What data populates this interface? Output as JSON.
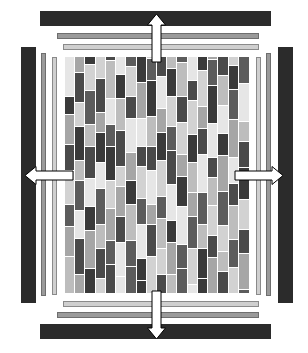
{
  "figure": {
    "canvas": {
      "width": 308,
      "height": 353,
      "background": "#ffffff"
    }
  },
  "palette": {
    "frame_dark": "#2b2b2b",
    "rail_mid": "#9a9a9a",
    "rail_light": "#cfcfcf",
    "rail_stroke_mid": "#6e6e6e",
    "rail_stroke_light": "#8a8a8a",
    "arrow_fill": "#ffffff",
    "arrow_stroke": "#000000",
    "cell_grid_line": "#ffffff",
    "swatches": [
      "#2c2c2c",
      "#3a3a3a",
      "#4a4a4a",
      "#5c5c5c",
      "#707070",
      "#8a8a8a",
      "#a6a6a6",
      "#bdbdbd",
      "#d2d2d2",
      "#e6e6e6"
    ]
  },
  "frame_bars": [
    {
      "name": "top-frame-bar",
      "edge": "top",
      "kind": "dark",
      "x": 40,
      "y": 11,
      "w": 231,
      "h": 15
    },
    {
      "name": "bottom-frame-bar",
      "edge": "bottom",
      "kind": "dark",
      "x": 40,
      "y": 324,
      "w": 231,
      "h": 15
    },
    {
      "name": "left-frame-bar",
      "edge": "left",
      "kind": "dark",
      "x": 21,
      "y": 47,
      "w": 15,
      "h": 256
    },
    {
      "name": "right-frame-bar",
      "edge": "right",
      "kind": "dark",
      "x": 278,
      "y": 47,
      "w": 15,
      "h": 256
    }
  ],
  "rail_bars": [
    {
      "name": "top-rail-outer",
      "edge": "top",
      "kind": "mid",
      "x": 57,
      "y": 33,
      "w": 202,
      "h": 6
    },
    {
      "name": "top-rail-inner",
      "edge": "top",
      "kind": "light",
      "x": 63,
      "y": 44,
      "w": 196,
      "h": 6
    },
    {
      "name": "bottom-rail-inner",
      "edge": "bottom",
      "kind": "light",
      "x": 63,
      "y": 301,
      "w": 196,
      "h": 6
    },
    {
      "name": "bottom-rail-outer",
      "edge": "bottom",
      "kind": "mid",
      "x": 57,
      "y": 312,
      "w": 202,
      "h": 6
    },
    {
      "name": "left-rail-outer",
      "edge": "left",
      "kind": "mid",
      "x": 41,
      "y": 53,
      "w": 5,
      "h": 243
    },
    {
      "name": "left-rail-inner",
      "edge": "left",
      "kind": "light",
      "x": 52,
      "y": 57,
      "w": 5,
      "h": 238
    },
    {
      "name": "right-rail-inner",
      "edge": "right",
      "kind": "light",
      "x": 256,
      "y": 57,
      "w": 5,
      "h": 238
    },
    {
      "name": "right-rail-outer",
      "edge": "right",
      "kind": "mid",
      "x": 266,
      "y": 53,
      "w": 5,
      "h": 243
    }
  ],
  "arrows": [
    {
      "name": "arrow-up",
      "direction": "up",
      "label": "expansion up",
      "x": 151,
      "y": 14,
      "length": 48,
      "thickness": 9
    },
    {
      "name": "arrow-down",
      "direction": "down",
      "label": "expansion down",
      "x": 151,
      "y": 291,
      "length": 48,
      "thickness": 9
    },
    {
      "name": "arrow-left",
      "direction": "left",
      "label": "expansion left",
      "x": 25,
      "y": 170,
      "length": 48,
      "thickness": 9
    },
    {
      "name": "arrow-right",
      "direction": "right",
      "label": "expansion right",
      "x": 235,
      "y": 170,
      "length": 48,
      "thickness": 9
    }
  ],
  "grid": {
    "name": "block-grid",
    "x": 65,
    "y": 57,
    "width": 184,
    "height": 237,
    "columns": 18,
    "description": "Interlocking staggered vertical blocks in shades of grey",
    "column_data": [
      {
        "offset": 0,
        "cells": [
          40,
          18,
          30,
          26,
          34,
          22,
          30,
          38
        ]
      },
      {
        "offset": 16,
        "cells": [
          30,
          24,
          34,
          20,
          30,
          28,
          36,
          34
        ]
      },
      {
        "offset": 8,
        "cells": [
          26,
          34,
          22,
          32,
          28,
          24,
          38,
          32
        ]
      },
      {
        "offset": 22,
        "cells": [
          34,
          20,
          30,
          26,
          36,
          24,
          30,
          36
        ]
      },
      {
        "offset": 4,
        "cells": [
          38,
          26,
          22,
          34,
          28,
          32,
          24,
          36
        ]
      },
      {
        "offset": 18,
        "cells": [
          24,
          32,
          36,
          20,
          30,
          26,
          34,
          28
        ]
      },
      {
        "offset": 10,
        "cells": [
          30,
          22,
          34,
          28,
          24,
          36,
          26,
          32
        ]
      },
      {
        "offset": 26,
        "cells": [
          36,
          28,
          20,
          32,
          26,
          34,
          22,
          30
        ]
      },
      {
        "offset": 2,
        "cells": [
          22,
          36,
          30,
          24,
          34,
          20,
          32,
          38
        ]
      },
      {
        "offset": 20,
        "cells": [
          32,
          24,
          28,
          36,
          22,
          30,
          26,
          34
        ]
      },
      {
        "offset": 12,
        "cells": [
          28,
          30,
          24,
          34,
          36,
          22,
          32,
          20
        ]
      },
      {
        "offset": 6,
        "cells": [
          34,
          26,
          32,
          22,
          30,
          38,
          24,
          28
        ]
      },
      {
        "offset": 24,
        "cells": [
          20,
          34,
          28,
          30,
          24,
          32,
          36,
          26
        ]
      },
      {
        "offset": 14,
        "cells": [
          36,
          22,
          26,
          38,
          32,
          24,
          30,
          22
        ]
      },
      {
        "offset": 3,
        "cells": [
          26,
          38,
          34,
          20,
          28,
          30,
          22,
          36
        ]
      },
      {
        "offset": 19,
        "cells": [
          30,
          28,
          22,
          36,
          34,
          26,
          20,
          32
        ]
      },
      {
        "offset": 9,
        "cells": [
          24,
          30,
          38,
          26,
          22,
          34,
          28,
          30
        ]
      },
      {
        "offset": 27,
        "cells": [
          38,
          20,
          26,
          32,
          30,
          24,
          36,
          22
        ]
      }
    ],
    "column_shades": [
      [
        7,
        9,
        1,
        6,
        2,
        8,
        3,
        6
      ],
      [
        6,
        2,
        8,
        1,
        7,
        3,
        9,
        2
      ],
      [
        1,
        8,
        3,
        7,
        2,
        9,
        1,
        6
      ],
      [
        8,
        2,
        6,
        1,
        9,
        3,
        7,
        2
      ],
      [
        2,
        7,
        9,
        3,
        1,
        8,
        6,
        3
      ],
      [
        9,
        1,
        7,
        2,
        8,
        6,
        2,
        9
      ],
      [
        3,
        8,
        2,
        9,
        6,
        1,
        7,
        3
      ],
      [
        1,
        6,
        9,
        2,
        8,
        3,
        9,
        1
      ],
      [
        8,
        3,
        1,
        7,
        2,
        9,
        6,
        2
      ],
      [
        2,
        9,
        6,
        1,
        8,
        3,
        7,
        8
      ],
      [
        7,
        1,
        8,
        3,
        2,
        9,
        1,
        6
      ],
      [
        3,
        7,
        2,
        8,
        6,
        1,
        9,
        3
      ],
      [
        9,
        2,
        8,
        1,
        7,
        6,
        3,
        8
      ],
      [
        1,
        8,
        6,
        2,
        9,
        3,
        7,
        1
      ],
      [
        6,
        3,
        1,
        9,
        2,
        7,
        8,
        2
      ],
      [
        2,
        7,
        9,
        1,
        6,
        3,
        8,
        7
      ],
      [
        8,
        1,
        3,
        6,
        9,
        2,
        7,
        3
      ],
      [
        3,
        9,
        7,
        2,
        1,
        8,
        2,
        6
      ]
    ]
  }
}
